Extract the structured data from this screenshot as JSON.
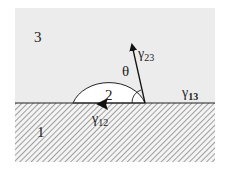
{
  "diagram": {
    "regions": [
      {
        "id": "1",
        "label": "1",
        "description": "solid substrate (hatched)"
      },
      {
        "id": "2",
        "label": "2",
        "description": "droplet phase"
      },
      {
        "id": "3",
        "label": "3",
        "description": "surrounding phase (gray)"
      }
    ],
    "labels": {
      "region1": "1",
      "region2": "2",
      "region3": "3",
      "gamma12": "γ12",
      "gamma12_base": "γ",
      "gamma12_sub": "12",
      "gamma13_base": "γ",
      "gamma13_sub": "13",
      "gamma23_base": "γ",
      "gamma23_sub": "23",
      "theta": "θ"
    },
    "vectors": [
      {
        "name": "gamma23",
        "direction": "up-left along droplet tangent"
      },
      {
        "name": "gamma12",
        "direction": "left along interface"
      },
      {
        "name": "gamma13",
        "direction": "right along interface (label only)"
      }
    ],
    "colors": {
      "background": "#ffffff",
      "region3_fill": "#ececec",
      "droplet_fill": "#ffffff",
      "hatch_line": "#8a8a8a",
      "stroke": "#222222"
    }
  }
}
